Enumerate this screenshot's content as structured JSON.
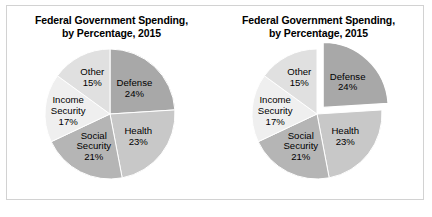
{
  "figure": {
    "background_color": "#ffffff",
    "border_color": "#d2d2d2"
  },
  "panels": [
    {
      "id": "left",
      "title_line1": "Federal Government Spending,",
      "title_line2": "by Percentage, 2015",
      "exploded_slice": ""
    },
    {
      "id": "right",
      "title_line1": "Federal Government Spending,",
      "title_line2": "by Percentage, 2015",
      "exploded_slice": "Defense"
    }
  ],
  "chart_data": {
    "type": "pie",
    "title": "Federal Government Spending, by Percentage, 2015",
    "categories": [
      "Defense",
      "Health",
      "Social Security",
      "Income Security",
      "Other"
    ],
    "values": [
      24,
      23,
      21,
      17,
      15
    ],
    "value_suffix": "%",
    "colors": [
      "#a8a8a8",
      "#c8c8c8",
      "#b5b5b5",
      "#efefef",
      "#e0e0e0"
    ],
    "start_angle_deg": 0,
    "direction": "clockwise",
    "legend": "none",
    "slice_labels": [
      {
        "name": "Defense",
        "value": "24%",
        "lines": [
          "Defense",
          "24%"
        ]
      },
      {
        "name": "Health",
        "value": "23%",
        "lines": [
          "Health",
          "23%"
        ]
      },
      {
        "name": "Social Security",
        "value": "21%",
        "lines": [
          "Social",
          "Security",
          "21%"
        ]
      },
      {
        "name": "Income Security",
        "value": "17%",
        "lines": [
          "Income",
          "Security",
          "17%"
        ]
      },
      {
        "name": "Other",
        "value": "15%",
        "lines": [
          "Other",
          "15%"
        ]
      }
    ],
    "variants": [
      {
        "id": "left",
        "exploded": []
      },
      {
        "id": "right",
        "exploded": [
          "Defense"
        ]
      }
    ]
  }
}
